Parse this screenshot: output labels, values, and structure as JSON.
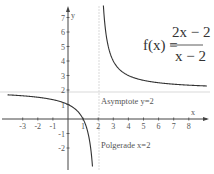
{
  "chart_data": {
    "type": "line",
    "formula": {
      "lhs": "f(x) =",
      "numerator": "2x − 2",
      "denominator": "x − 2"
    },
    "xlabel": "x",
    "ylabel": "y",
    "xlim": [
      -3.6,
      9
    ],
    "ylim": [
      -2.6,
      8
    ],
    "x_ticks": [
      -3,
      -2,
      -1,
      1,
      2,
      3,
      4,
      5,
      6,
      7,
      8
    ],
    "y_ticks": [
      -2,
      -1,
      1,
      2,
      3,
      4,
      5,
      6,
      7
    ],
    "grid": false,
    "series": [
      {
        "name": "f(x) left branch",
        "x": [
          -4,
          -3,
          -2,
          -1,
          0,
          0.5,
          1,
          1.3,
          1.5,
          1.6
        ],
        "y": [
          1.67,
          1.6,
          1.5,
          1.33,
          1,
          0.67,
          0,
          -0.86,
          -2,
          -3
        ]
      },
      {
        "name": "f(x) right branch",
        "x": [
          2.29,
          2.4,
          2.5,
          3,
          4,
          5,
          6,
          7,
          8,
          9
        ],
        "y": [
          9,
          7,
          6,
          4,
          3,
          2.67,
          2.5,
          2.4,
          2.33,
          2.29
        ]
      }
    ],
    "annotations": [
      {
        "text": "Asymptote y=2",
        "type": "horizontal_asymptote",
        "value": 2
      },
      {
        "text": "Polgerade x=2",
        "type": "vertical_asymptote",
        "value": 2
      }
    ]
  },
  "labels": {
    "x_axis": "x",
    "y_axis": "y",
    "asymptote": "Asymptote y=2",
    "pole": "Polgerade x=2",
    "formula_lhs": "f(x) =",
    "formula_num": "2x − 2",
    "formula_den": "x − 2"
  },
  "colors": {
    "curve": "#333333",
    "axis": "#444444",
    "asymptote": "#d0d0d0",
    "text": "#555555"
  }
}
